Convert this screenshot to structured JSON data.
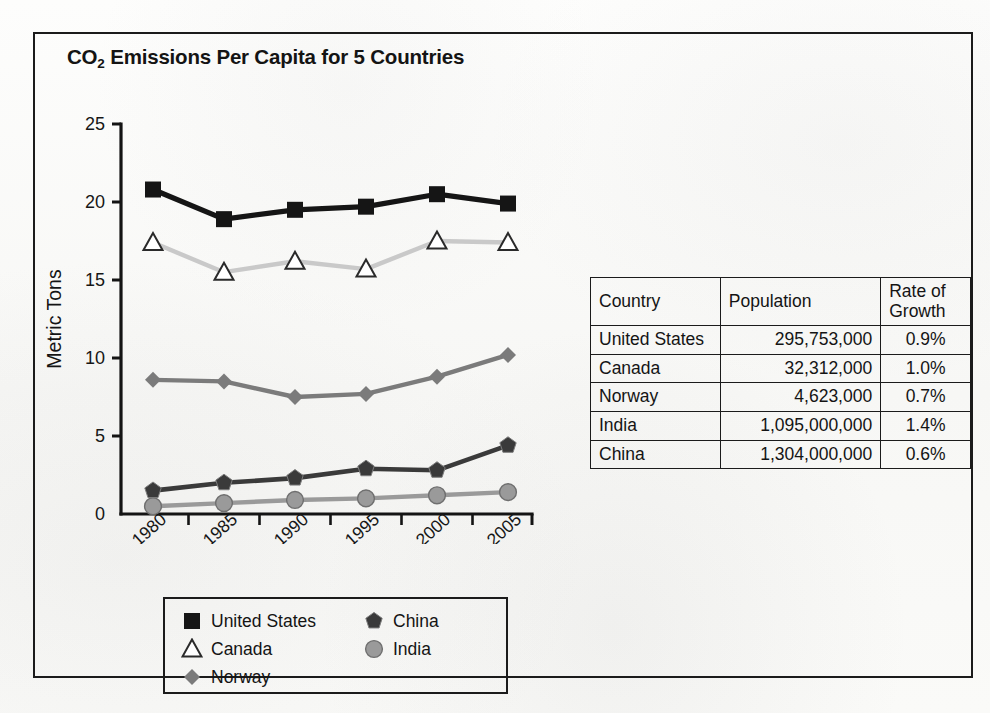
{
  "figure": {
    "title_main": "CO",
    "title_sub": "2",
    "title_rest": " Emissions Per Capita for 5 Countries"
  },
  "chart_data": {
    "type": "line",
    "title": "CO2 Emissions Per Capita for 5 Countries",
    "xlabel": "",
    "ylabel": "Metric Tons",
    "categories": [
      "1980",
      "1985",
      "1990",
      "1995",
      "2000",
      "2005"
    ],
    "x": [
      1980,
      1985,
      1990,
      1995,
      2000,
      2005
    ],
    "ylim": [
      0,
      25
    ],
    "yticks": [
      "0",
      "5",
      "10",
      "15",
      "20",
      "25"
    ],
    "grid": false,
    "legend_position": "below-plot",
    "series": [
      {
        "name": "United States",
        "marker": "filled-square",
        "color": "#151515",
        "values": [
          20.8,
          18.9,
          19.5,
          19.7,
          20.5,
          19.9
        ]
      },
      {
        "name": "Canada",
        "marker": "open-triangle",
        "color": "#c9c9c9",
        "values": [
          17.4,
          15.5,
          16.2,
          15.7,
          17.5,
          17.4
        ]
      },
      {
        "name": "Norway",
        "marker": "filled-diamond",
        "color": "#7b7b7b",
        "values": [
          8.6,
          8.5,
          7.5,
          7.7,
          8.8,
          10.2
        ]
      },
      {
        "name": "China",
        "marker": "filled-pentagon",
        "color": "#3a3a3a",
        "values": [
          1.5,
          2.0,
          2.3,
          2.9,
          2.8,
          4.4
        ]
      },
      {
        "name": "India",
        "marker": "filled-circle",
        "color": "#9a9a9a",
        "values": [
          0.5,
          0.7,
          0.9,
          1.0,
          1.2,
          1.4
        ]
      }
    ]
  },
  "legend": {
    "left_column": [
      {
        "label": "United States",
        "marker": "filled-square"
      },
      {
        "label": "Canada",
        "marker": "open-triangle"
      },
      {
        "label": "Norway",
        "marker": "filled-diamond"
      }
    ],
    "right_column": [
      {
        "label": "China",
        "marker": "filled-pentagon"
      },
      {
        "label": "India",
        "marker": "filled-circle"
      }
    ]
  },
  "table": {
    "headers": [
      "Country",
      "Population",
      "Rate of Growth"
    ],
    "header_rate_line1": "Rate of",
    "header_rate_line2": "Growth",
    "rows": [
      {
        "country": "United States",
        "population": "295,753,000",
        "rate": "0.9%"
      },
      {
        "country": "Canada",
        "population": "32,312,000",
        "rate": "1.0%"
      },
      {
        "country": "Norway",
        "population": "4,623,000",
        "rate": "0.7%"
      },
      {
        "country": "India",
        "population": "1,095,000,000",
        "rate": "1.4%"
      },
      {
        "country": "China",
        "population": "1,304,000,000",
        "rate": "0.6%"
      }
    ]
  },
  "colors": {
    "ink": "#1b1b1b",
    "page": "#fbfbfa",
    "united_states": "#151515",
    "canada": "#c9c9c9",
    "norway": "#7b7b7b",
    "china": "#3a3a3a",
    "india": "#9a9a9a"
  }
}
